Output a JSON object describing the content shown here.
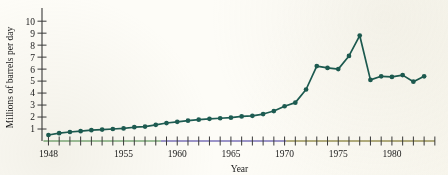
{
  "figure": {
    "background_color": "#fdfcf7",
    "line_color": "#1d5c52",
    "marker_color": "#1d5c52",
    "axis_color": "#3a3a3a",
    "axis_fringe_left_color": "#7fae7c",
    "axis_fringe_mid_color": "#7b73b8",
    "axis_fringe_right_color": "#9a9457"
  },
  "chart_data": {
    "type": "line",
    "title": "",
    "xlabel": "Year",
    "ylabel": "Millions of barrels per day",
    "xlim": [
      1947.4,
      1984.2
    ],
    "ylim": [
      0,
      10.6
    ],
    "grid": false,
    "legend": null,
    "y_ticks": [
      1,
      2,
      3,
      4,
      5,
      6,
      7,
      8,
      9,
      10
    ],
    "y_ticklabels": [
      "1",
      "2",
      "3",
      "4",
      "5",
      "6",
      "7",
      "8",
      "9",
      "10"
    ],
    "x_ticks": [
      1948,
      1949,
      1950,
      1951,
      1952,
      1953,
      1954,
      1955,
      1956,
      1957,
      1958,
      1959,
      1960,
      1961,
      1962,
      1963,
      1964,
      1965,
      1966,
      1967,
      1968,
      1969,
      1970,
      1971,
      1972,
      1973,
      1974,
      1975,
      1976,
      1977,
      1978,
      1979,
      1980,
      1981,
      1982,
      1983,
      1984
    ],
    "x_ticklabels": [
      {
        "x": 1948,
        "label": "1948"
      },
      {
        "x": 1955,
        "label": "1955"
      },
      {
        "x": 1960,
        "label": "1960"
      },
      {
        "x": 1965,
        "label": "1965"
      },
      {
        "x": 1970,
        "label": "1970"
      },
      {
        "x": 1975,
        "label": "1975"
      },
      {
        "x": 1980,
        "label": "1980"
      }
    ],
    "series": [
      {
        "name": "Oil imports",
        "x": [
          1948,
          1949,
          1950,
          1951,
          1952,
          1953,
          1954,
          1955,
          1956,
          1957,
          1958,
          1959,
          1960,
          1961,
          1962,
          1963,
          1964,
          1965,
          1966,
          1967,
          1968,
          1969,
          1970,
          1971,
          1972,
          1973,
          1974,
          1975,
          1976,
          1977,
          1978,
          1979,
          1980,
          1981,
          1982,
          1983
        ],
        "values": [
          0.5,
          0.65,
          0.75,
          0.82,
          0.9,
          0.95,
          1.0,
          1.05,
          1.15,
          1.2,
          1.35,
          1.5,
          1.6,
          1.7,
          1.78,
          1.85,
          1.9,
          1.95,
          2.05,
          2.1,
          2.25,
          2.5,
          2.9,
          3.2,
          4.3,
          6.25,
          6.1,
          6.0,
          7.1,
          8.8,
          5.1,
          5.4,
          5.35,
          5.5,
          4.95,
          5.4
        ]
      }
    ]
  }
}
